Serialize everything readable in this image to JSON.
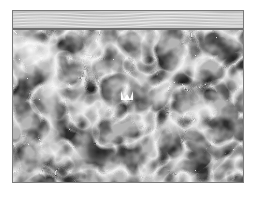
{
  "image": {
    "description": "Grayscale cloudy cellular texture with a wavy striped band across the top",
    "palette": {
      "background": "#ffffff",
      "frame_border": "#7a7a7a",
      "band_base": "#c9c9c9",
      "band_divider": "#6e6e6e",
      "texture_light": "#f4f4f4",
      "texture_mid": "#9a9a9a",
      "texture_dark": "#1e1e1e"
    },
    "regions": [
      {
        "name": "striped-band",
        "x": 12,
        "y": 10,
        "width": 232,
        "height": 18
      },
      {
        "name": "cellular-texture",
        "x": 12,
        "y": 29,
        "width": 232,
        "height": 154
      },
      {
        "name": "bright-marker",
        "x": 120,
        "y": 88,
        "width": 16,
        "height": 10
      }
    ]
  }
}
